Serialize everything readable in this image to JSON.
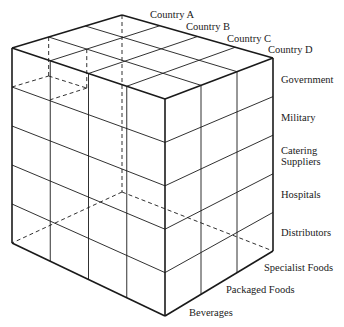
{
  "diagram": {
    "type": "3d-cube-matrix",
    "axes": {
      "countries": {
        "orientation": "top edge, back to right",
        "labels": [
          "Country A",
          "Country B",
          "Country C",
          "Country D"
        ]
      },
      "customer_types": {
        "orientation": "right vertical edge, top to bottom",
        "labels": [
          "Government",
          "Military",
          "Catering\nSuppliers",
          "Hospitals",
          "Distributors"
        ]
      },
      "product_categories": {
        "orientation": "bottom-right edge, front to right",
        "labels": [
          "Beverages",
          "Packaged Foods",
          "Specialist Foods"
        ]
      }
    },
    "grid": {
      "country_divisions": 4,
      "customer_divisions": 5,
      "product_divisions": 3
    },
    "colors": {
      "line": "#1a1a1a",
      "background": "#ffffff"
    }
  },
  "labels": {
    "country_a": "Country A",
    "country_b": "Country B",
    "country_c": "Country C",
    "country_d": "Country D",
    "government": "Government",
    "military": "Military",
    "catering_1": "Catering",
    "catering_2": "Suppliers",
    "hospitals": "Hospitals",
    "distributors": "Distributors",
    "specialist_foods": "Specialist Foods",
    "packaged_foods": "Packaged Foods",
    "beverages": "Beverages"
  }
}
